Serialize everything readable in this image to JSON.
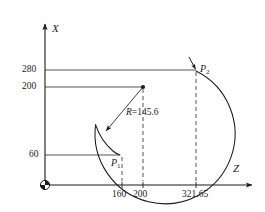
{
  "figure": {
    "type": "engineering-coordinate-diagram",
    "background_color": "#ffffff",
    "line_color": "#1b1b1b",
    "axes": {
      "vertical_label": "X",
      "horizontal_label": "Z",
      "origin_symbol": "machining-origin-quadrant-circle"
    },
    "x_axis_ticks": [
      {
        "label": "280",
        "value": 280
      },
      {
        "label": "200",
        "value": 200
      },
      {
        "label": "60",
        "value": 60
      }
    ],
    "z_axis_ticks": [
      {
        "label": "160",
        "value": 160
      },
      {
        "label": "200",
        "value": 200
      },
      {
        "label": "321.65",
        "value": 321.65
      }
    ],
    "points": [
      {
        "name": "P1",
        "label": "P",
        "subscript": "1",
        "z": 160,
        "x": 60
      },
      {
        "name": "P2",
        "label": "P",
        "subscript": "2",
        "z": 321.65,
        "x": 280
      }
    ],
    "arc": {
      "center_label": "arc-center",
      "center_z": 200,
      "center_x": 200,
      "radius_label": "R=145.6",
      "radius_prefix": "R",
      "radius_equals": "=",
      "radius_value": "145.6",
      "radius": 145.6,
      "direction": "counterclockwise"
    }
  }
}
